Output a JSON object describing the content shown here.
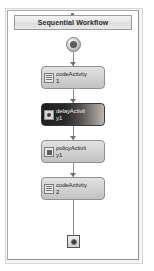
{
  "designer": {
    "title": "Sequential Workflow",
    "collapse_handle": "collapse-handle",
    "start_icon": "start-icon",
    "end_icon": "terminate-icon",
    "accent_selected_color": "#201f1f",
    "box_fill_color": "#d2d2d2",
    "box_border_color": "#909090",
    "connector_color": "#8c8c8c"
  },
  "activities": [
    {
      "name": "codeActivity1",
      "label": "codeActivity\n1",
      "icon": "code-activity-icon",
      "selected": false
    },
    {
      "name": "delayActivity1",
      "label": "delayActivit\ny1",
      "icon": "delay-activity-icon",
      "selected": true
    },
    {
      "name": "policyActivity1",
      "label": "policyActivit\ny1",
      "icon": "policy-activity-icon",
      "selected": false
    },
    {
      "name": "codeActivity2",
      "label": "codeActivity\n2",
      "icon": "code-activity-icon",
      "selected": false
    }
  ]
}
